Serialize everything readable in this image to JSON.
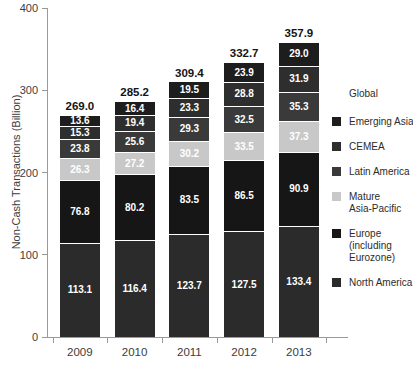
{
  "chart_data": {
    "type": "bar",
    "stacked": true,
    "title": "",
    "ylabel": "Non-Cash Transactions (Billion)",
    "xlabel": "",
    "ylim": [
      0,
      400
    ],
    "yticks": [
      0,
      100,
      200,
      300,
      400
    ],
    "grid": false,
    "categories": [
      "2009",
      "2010",
      "2011",
      "2012",
      "2013"
    ],
    "totals": [
      269.0,
      285.2,
      309.4,
      332.7,
      357.9
    ],
    "series": [
      {
        "name": "North America",
        "color": "#2b2b2b",
        "values": [
          113.1,
          116.4,
          123.7,
          127.5,
          133.4
        ]
      },
      {
        "name": "Europe (including Eurozone)",
        "color": "#161616",
        "values": [
          76.8,
          80.2,
          83.5,
          86.5,
          90.9
        ]
      },
      {
        "name": "Mature Asia-Pacific",
        "color": "#c8c8c8",
        "values": [
          26.3,
          27.2,
          30.2,
          33.5,
          37.3
        ]
      },
      {
        "name": "Latin America",
        "color": "#3a3a3a",
        "values": [
          23.8,
          25.6,
          29.3,
          32.5,
          35.3
        ]
      },
      {
        "name": "CEMEA",
        "color": "#2e2e2e",
        "values": [
          15.3,
          19.4,
          23.3,
          28.8,
          31.9
        ]
      },
      {
        "name": "Emerging Asia",
        "color": "#1d1d1d",
        "values": [
          13.6,
          16.4,
          19.5,
          23.9,
          29.0
        ]
      }
    ],
    "legend": {
      "position": "right",
      "header": "Global",
      "items": [
        {
          "name": "Emerging Asia",
          "lines": [
            "Emerging Asia"
          ]
        },
        {
          "name": "CEMEA",
          "lines": [
            "CEMEA"
          ]
        },
        {
          "name": "Latin America",
          "lines": [
            "Latin America"
          ]
        },
        {
          "name": "Mature Asia-Pacific",
          "lines": [
            "Mature",
            "Asia-Pacific"
          ]
        },
        {
          "name": "Europe (including Eurozone)",
          "lines": [
            "Europe",
            "(including",
            "Eurozone)"
          ]
        },
        {
          "name": "North America",
          "lines": [
            "North America"
          ]
        }
      ]
    },
    "colors": {
      "axis": "#9a9a9a",
      "tick_text": "#3d3d3d",
      "total_text": "#141414",
      "value_text": "#ffffff",
      "background": "#ffffff"
    }
  }
}
